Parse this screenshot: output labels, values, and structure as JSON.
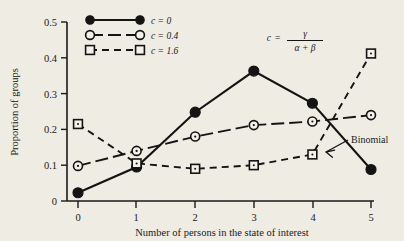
{
  "chart_data": {
    "type": "line",
    "title": "",
    "xlabel": "Number of persons in the state of interest",
    "ylabel": "Proportion of groups",
    "x": [
      0,
      1,
      2,
      3,
      4,
      5
    ],
    "xticklabels": [
      "0",
      "1",
      "2",
      "3",
      "4",
      "5"
    ],
    "yticks": [
      0,
      0.1,
      0.2,
      0.3,
      0.4,
      0.5
    ],
    "yticklabels": [
      "0",
      "0.1",
      "0.2",
      "0.3",
      "0.4",
      "0.5"
    ],
    "xlim": [
      -0.35,
      5.35
    ],
    "ylim": [
      0,
      0.5
    ],
    "grid": false,
    "legend_position": "top-left",
    "series": [
      {
        "name": "c = 0",
        "marker": "filled-circle",
        "linestyle": "solid",
        "values": [
          0.023,
          0.095,
          0.248,
          0.363,
          0.273,
          0.088
        ]
      },
      {
        "name": "c = 0.4",
        "marker": "open-circle",
        "linestyle": "long-dash",
        "values": [
          0.098,
          0.14,
          0.18,
          0.212,
          0.222,
          0.24
        ]
      },
      {
        "name": "c = 1.6",
        "marker": "open-square",
        "linestyle": "dashed",
        "values": [
          0.215,
          0.105,
          0.09,
          0.1,
          0.13,
          0.412
        ]
      }
    ],
    "annotations": [
      {
        "text": "Binomial",
        "target_series": "c = 0",
        "target_x": 4.55,
        "target_y": 0.185
      }
    ],
    "formula": {
      "lhs": "c",
      "equals": "=",
      "numerator": "γ",
      "denominator": "α + β"
    }
  },
  "colors": {
    "background": "#efece4",
    "ink": "#141414",
    "marker_face": "#f3f1ea"
  }
}
